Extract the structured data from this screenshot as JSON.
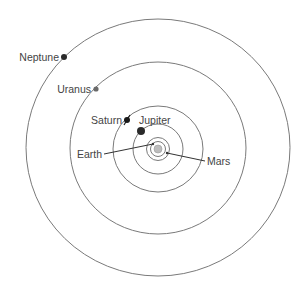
{
  "diagram": {
    "title": "",
    "center": {
      "x": 158,
      "y": 149
    },
    "colors": {
      "orbit": "#7a7a7a",
      "planet_dark": "#2a2a2a",
      "planet_gray": "#6a6a6a",
      "sun_fill": "#bdbdbd",
      "text": "#444444"
    },
    "sun": {
      "label": "",
      "r": 4
    },
    "planets": [
      {
        "name": "Mars",
        "label": "Mars"
      },
      {
        "name": "Earth",
        "label": "Earth"
      },
      {
        "name": "Jupiter",
        "label": "Jupiter"
      },
      {
        "name": "Saturn",
        "label": "Saturn"
      },
      {
        "name": "Uranus",
        "label": "Uranus"
      },
      {
        "name": "Neptune",
        "label": "Neptune"
      }
    ]
  }
}
